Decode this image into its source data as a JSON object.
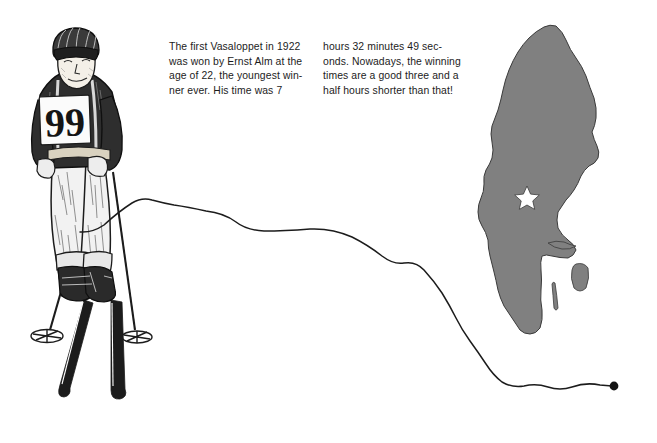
{
  "page": {
    "width": 657,
    "height": 443,
    "background_color": "#ffffff",
    "ink_color": "#1c1c1c",
    "map_fill_color": "#808080",
    "map_outline_color": "#3a3a3a"
  },
  "caption": {
    "column_left": "The first Vasaloppet in 1922\nwas won by Ernst Alm at the\nage of 22, the youngest win-\nner ever. His time was 7",
    "column_right": "hours 32 minutes 49 sec-\nonds. Nowadays, the winning\ntimes are a good three and a\nhalf hours shorter than that!"
  },
  "illustration": {
    "skier": {
      "label": "vintage-skier-line-drawing",
      "bib_number": "99",
      "equipment": [
        "knitted-cap",
        "ski-poles",
        "wooden-skis",
        "knickers"
      ]
    },
    "trail": {
      "label": "ski-track-curve",
      "start_point": "80,232",
      "end_point": "614,386",
      "end_marker": "filled-dot"
    },
    "map": {
      "label": "map-of-sweden",
      "marker": "white-star",
      "marker_position": "527,196",
      "marker_meaning": "vasaloppet-region",
      "islands": [
        "oland",
        "gotland"
      ]
    }
  }
}
